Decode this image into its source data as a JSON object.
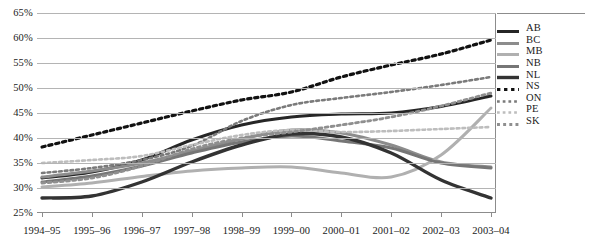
{
  "chart_data": {
    "type": "line",
    "title": "",
    "xlabel": "",
    "ylabel": "",
    "grid": true,
    "legend_position": "right",
    "ylim": [
      25,
      65
    ],
    "y_tick_labels": [
      "25%",
      "30%",
      "35%",
      "40%",
      "45%",
      "50%",
      "55%",
      "60%",
      "65%"
    ],
    "y_tick_values": [
      25,
      30,
      35,
      40,
      45,
      50,
      55,
      60,
      65
    ],
    "categories": [
      "1994–95",
      "1995–96",
      "1996–97",
      "1997–98",
      "1998–99",
      "1999–00",
      "2000–01",
      "2001–02",
      "2002–03",
      "2003–04"
    ],
    "series": [
      {
        "name": "AB",
        "style": "solid",
        "color": "#262626",
        "width": 3.0,
        "values": [
          32.0,
          33.2,
          35.6,
          39.6,
          42.6,
          44.2,
          44.8,
          45.0,
          46.3,
          48.4
        ]
      },
      {
        "name": "BC",
        "style": "solid",
        "color": "#8c8c8c",
        "width": 3.0,
        "values": [
          32.2,
          33.4,
          35.0,
          37.4,
          39.8,
          41.6,
          41.0,
          38.6,
          35.2,
          34.2
        ]
      },
      {
        "name": "MB",
        "style": "solid",
        "color": "#b0b0b0",
        "width": 3.0,
        "values": [
          30.2,
          31.0,
          32.3,
          33.4,
          34.0,
          34.2,
          33.0,
          32.2,
          36.6,
          46.0
        ]
      },
      {
        "name": "NB",
        "style": "solid",
        "color": "#767676",
        "width": 3.0,
        "values": [
          31.2,
          32.4,
          34.4,
          37.0,
          39.2,
          40.4,
          39.4,
          38.0,
          35.0,
          34.0
        ]
      },
      {
        "name": "NL",
        "style": "solid",
        "color": "#333333",
        "width": 3.4,
        "values": [
          28.0,
          28.4,
          31.2,
          35.2,
          38.6,
          40.8,
          40.2,
          37.0,
          31.6,
          28.0
        ]
      },
      {
        "name": "NS",
        "style": "dotted",
        "color": "#111111",
        "width": 3.2,
        "values": [
          38.2,
          40.6,
          43.0,
          45.4,
          47.6,
          49.2,
          52.2,
          54.6,
          56.8,
          59.6
        ]
      },
      {
        "name": "ON",
        "style": "dotted",
        "color": "#7a7a7a",
        "width": 2.6,
        "values": [
          33.0,
          34.0,
          35.6,
          38.4,
          43.4,
          46.6,
          48.0,
          49.2,
          50.6,
          52.2
        ]
      },
      {
        "name": "PE",
        "style": "dotted",
        "color": "#bdbdbd",
        "width": 2.6,
        "values": [
          35.0,
          35.6,
          36.4,
          38.6,
          40.6,
          41.6,
          41.2,
          41.4,
          41.8,
          42.2
        ]
      },
      {
        "name": "SK",
        "style": "dotted",
        "color": "#8f8f8f",
        "width": 2.8,
        "values": [
          31.0,
          32.0,
          34.4,
          37.8,
          40.0,
          41.2,
          42.6,
          44.2,
          46.4,
          49.0
        ]
      }
    ]
  },
  "legend": {
    "items": [
      {
        "label": "AB"
      },
      {
        "label": "BC"
      },
      {
        "label": "MB"
      },
      {
        "label": "NB"
      },
      {
        "label": "NL"
      },
      {
        "label": "NS"
      },
      {
        "label": "ON"
      },
      {
        "label": "PE"
      },
      {
        "label": "SK"
      }
    ]
  }
}
